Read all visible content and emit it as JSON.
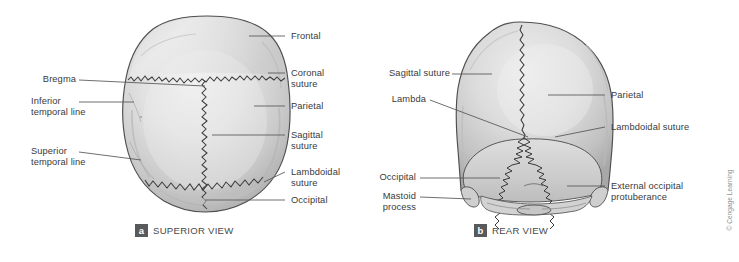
{
  "figure": {
    "background_color": "#ffffff",
    "label_text_color": "#3a3a3a",
    "bone_fill_color": "#d9d9d9",
    "bone_outline_color": "#4a4a4a",
    "suture_color": "#333333",
    "leader_line_color": "#555555",
    "badge_color": "#57595b"
  },
  "copyright": "© Cengage Learning",
  "panels": [
    {
      "id": "a",
      "badge": "a",
      "caption": "SUPERIOR VIEW",
      "labels": [
        {
          "id": "frontal",
          "text": "Frontal",
          "side": "right"
        },
        {
          "id": "coronal-suture",
          "text": "Coronal\nsuture",
          "side": "right"
        },
        {
          "id": "parietal",
          "text": "Parietal",
          "side": "right"
        },
        {
          "id": "sagittal-suture",
          "text": "Sagittal\nsuture",
          "side": "right"
        },
        {
          "id": "lambdoidal-suture",
          "text": "Lambdoidal\nsuture",
          "side": "right"
        },
        {
          "id": "occipital",
          "text": "Occipital",
          "side": "right"
        },
        {
          "id": "bregma",
          "text": "Bregma",
          "side": "left"
        },
        {
          "id": "inferior-temporal-line",
          "text": "Inferior\ntemporal line",
          "side": "left"
        },
        {
          "id": "superior-temporal-line",
          "text": "Superior\ntemporal line",
          "side": "left"
        }
      ]
    },
    {
      "id": "b",
      "badge": "b",
      "caption": "REAR VIEW",
      "labels": [
        {
          "id": "sagittal-suture",
          "text": "Sagittal suture",
          "side": "left"
        },
        {
          "id": "lambda",
          "text": "Lambda",
          "side": "left"
        },
        {
          "id": "occipital",
          "text": "Occipital",
          "side": "left"
        },
        {
          "id": "mastoid-process",
          "text": "Mastoid\nprocess",
          "side": "left"
        },
        {
          "id": "parietal",
          "text": "Parietal",
          "side": "right"
        },
        {
          "id": "lambdoidal-suture",
          "text": "Lambdoidal suture",
          "side": "right"
        },
        {
          "id": "external-occipital-protuberance",
          "text": "External occipital\nprotuberance",
          "side": "right"
        }
      ]
    }
  ]
}
